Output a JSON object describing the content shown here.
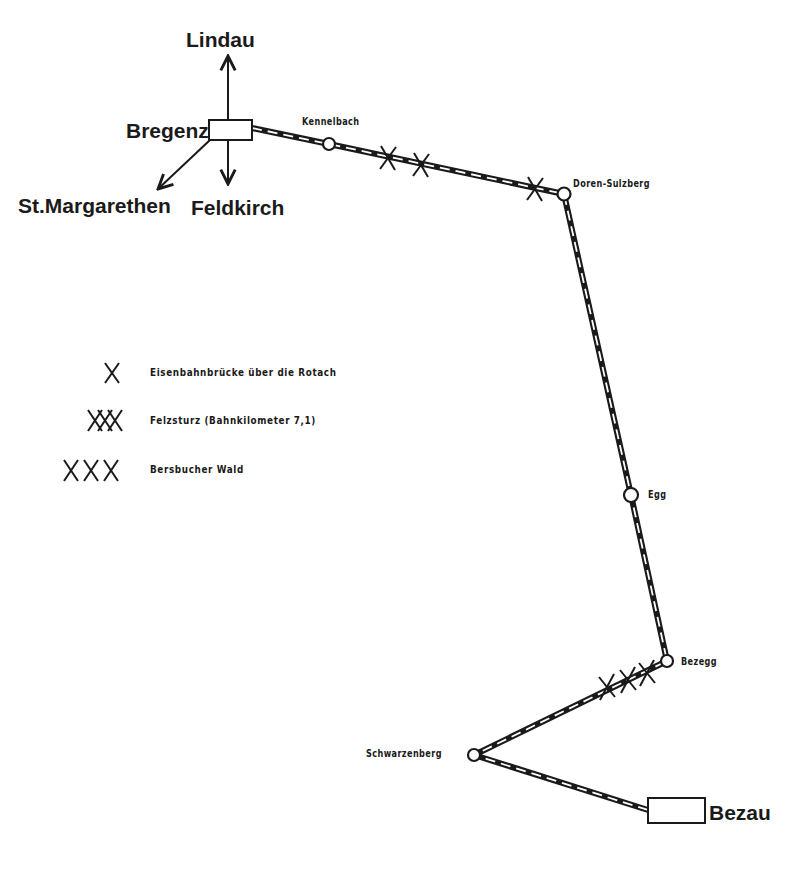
{
  "map": {
    "origin_station": {
      "name": "Bregenz"
    },
    "directions": [
      {
        "name": "Lindau",
        "icon": "arrow-up-icon"
      },
      {
        "name": "Feldkirch",
        "icon": "arrow-down-icon"
      },
      {
        "name": "St.Margarethen",
        "icon": "arrow-down-left-icon"
      }
    ],
    "stations": [
      {
        "name": "Kennelbach",
        "type": "stop"
      },
      {
        "name": "Doren-Sulzberg",
        "type": "stop"
      },
      {
        "name": "Egg",
        "type": "stop"
      },
      {
        "name": "Bezegg",
        "type": "stop"
      },
      {
        "name": "Schwarzenberg",
        "type": "stop"
      },
      {
        "name": "Bezau",
        "type": "terminus"
      }
    ],
    "legend": [
      {
        "symbol": "X",
        "label": "Eisenbahnbrücke über  die Rotach"
      },
      {
        "symbol": "XX",
        "label": "Felzsturz (Bahnkilometer 7,1)"
      },
      {
        "symbol": "XXX",
        "label": "Bersbucher Wald"
      }
    ],
    "colors": {
      "ink": "#1a1a1a",
      "background": "#ffffff"
    }
  }
}
